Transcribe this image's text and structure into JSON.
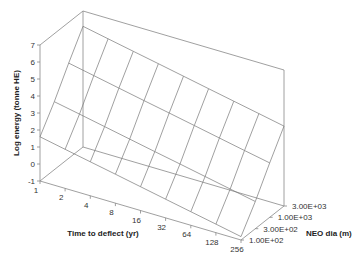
{
  "chart_data": {
    "type": "surface3d",
    "title": "",
    "xlabel": "Time to deflect (yr)",
    "ylabel": "NEO dia (m)",
    "zlabel": "Log energy (tonne HE)",
    "x_ticks": [
      "1",
      "2",
      "4",
      "8",
      "16",
      "32",
      "64",
      "128",
      "256"
    ],
    "y_ticks": [
      "1.00E+02",
      "3.00E+02",
      "1.00E+03",
      "3.00E+03"
    ],
    "z_ticks": [
      "-1",
      "0",
      "1",
      "2",
      "3",
      "4",
      "5",
      "6",
      "7"
    ],
    "zlim": [
      -1,
      7
    ],
    "x": [
      1,
      2,
      4,
      8,
      16,
      32,
      64,
      128,
      256
    ],
    "y": [
      100,
      300,
      1000,
      3000
    ],
    "series": [
      {
        "name": "1.00E+02",
        "values": [
          1.6,
          1.3,
          1.0,
          0.7,
          0.4,
          0.1,
          -0.2,
          -0.5,
          -0.8
        ]
      },
      {
        "name": "3.00E+02",
        "values": [
          3.0,
          2.7,
          2.4,
          2.1,
          1.8,
          1.5,
          1.2,
          0.9,
          0.6
        ]
      },
      {
        "name": "1.00E+03",
        "values": [
          4.6,
          4.3,
          4.0,
          3.7,
          3.4,
          3.1,
          2.8,
          2.5,
          2.2
        ]
      },
      {
        "name": "3.00E+03",
        "values": [
          6.1,
          5.8,
          5.5,
          5.2,
          4.9,
          4.6,
          4.3,
          4.0,
          3.7
        ]
      }
    ],
    "grid": false,
    "legend": "none"
  }
}
